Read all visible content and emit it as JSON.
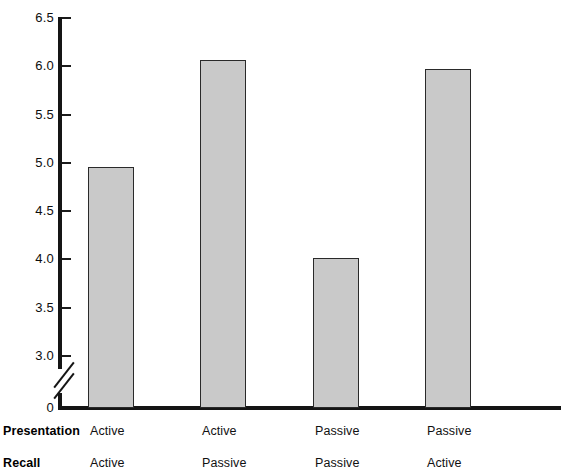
{
  "chart_data": {
    "type": "bar",
    "title": "",
    "subtitle": "",
    "xlabel": "",
    "ylabel": "",
    "categories": [
      "Active / Active",
      "Active / Passive",
      "Passive / Passive",
      "Passive / Active"
    ],
    "values": [
      4.96,
      6.06,
      4.01,
      5.97
    ],
    "series": [
      {
        "name": "",
        "values": [
          4.96,
          6.06,
          4.01,
          5.97
        ]
      }
    ],
    "ylim": [
      0,
      6.5
    ],
    "y_axis_break": true,
    "y_axis_break_between": [
      0,
      3.0
    ],
    "ytick_labels": [
      "6.5",
      "6.0",
      "5.5",
      "5.0",
      "4.5",
      "4.0",
      "3.5",
      "3.0",
      "0"
    ],
    "ytick_values": [
      6.5,
      6.0,
      5.5,
      5.0,
      4.5,
      4.0,
      3.5,
      3.0,
      0
    ],
    "grid": false,
    "legend": null,
    "bar_color": "#c9c9c9",
    "bar_edge_color": "#2a2a2a",
    "axis_color": "#151515",
    "factor_rows": [
      {
        "title": "Presentation",
        "levels": [
          "Active",
          "Active",
          "Passive",
          "Passive"
        ]
      },
      {
        "title": "Recall",
        "levels": [
          "Active",
          "Passive",
          "Passive",
          "Active"
        ]
      }
    ]
  }
}
